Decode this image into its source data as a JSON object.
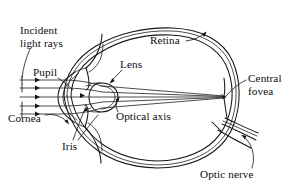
{
  "figure": {
    "background_color": "#ffffff",
    "line_color": "#151515"
  },
  "labels": {
    "incident_light_rays": "Incident\nlight rays",
    "pupil": "Pupil",
    "cornea": "Cornea",
    "iris": "Iris",
    "lens": "Lens",
    "optical_axis": "Optical axis",
    "retina": "Retina",
    "central_fovea": "Central\nfovea",
    "optic_nerve": "Optic nerve"
  },
  "parts": [
    {
      "name": "incident-light-rays",
      "label": "Incident light rays"
    },
    {
      "name": "pupil",
      "label": "Pupil"
    },
    {
      "name": "cornea",
      "label": "Cornea"
    },
    {
      "name": "iris",
      "label": "Iris"
    },
    {
      "name": "lens",
      "label": "Lens"
    },
    {
      "name": "optical-axis",
      "label": "Optical axis"
    },
    {
      "name": "retina",
      "label": "Retina"
    },
    {
      "name": "central-fovea",
      "label": "Central fovea"
    },
    {
      "name": "optic-nerve",
      "label": "Optic nerve"
    }
  ]
}
